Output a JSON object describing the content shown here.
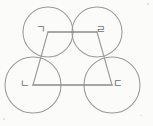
{
  "figure": {
    "background_color": "#fbfbfa",
    "stroke_color": "#9a9a9a",
    "label_color": "#6f6f6f",
    "vertices": [
      {
        "id": "top-left",
        "label": "ㄱ",
        "x": 48,
        "y": 32,
        "label_x": 41,
        "label_y": 30
      },
      {
        "id": "top-right",
        "label": "ㄹ",
        "x": 97,
        "y": 32,
        "label_x": 101,
        "label_y": 30
      },
      {
        "id": "bottom-left",
        "label": "ㄴ",
        "x": 33,
        "y": 85,
        "label_x": 25,
        "label_y": 84
      },
      {
        "id": "bottom-right",
        "label": "ㄷ",
        "x": 112,
        "y": 85,
        "label_x": 118,
        "label_y": 84
      }
    ],
    "circles": [
      {
        "id": "circle-top-left",
        "cx": 48,
        "cy": 32,
        "r": 25
      },
      {
        "id": "circle-top-right",
        "cx": 97,
        "cy": 32,
        "r": 25
      },
      {
        "id": "circle-bottom-left",
        "cx": 33,
        "cy": 85,
        "r": 28
      },
      {
        "id": "circle-bottom-right",
        "cx": 112,
        "cy": 85,
        "r": 28
      }
    ],
    "edges": [
      {
        "id": "edge-top",
        "from": "top-left",
        "to": "top-right",
        "x1": 48,
        "y1": 32,
        "x2": 97,
        "y2": 32
      },
      {
        "id": "edge-bottom",
        "from": "bottom-left",
        "to": "bottom-right",
        "x1": 33,
        "y1": 85,
        "x2": 112,
        "y2": 85
      },
      {
        "id": "edge-left",
        "from": "top-left",
        "to": "bottom-left",
        "x1": 48,
        "y1": 32,
        "x2": 33,
        "y2": 85
      },
      {
        "id": "edge-right",
        "from": "top-right",
        "to": "bottom-right",
        "x1": 97,
        "y1": 32,
        "x2": 112,
        "y2": 85
      }
    ]
  }
}
